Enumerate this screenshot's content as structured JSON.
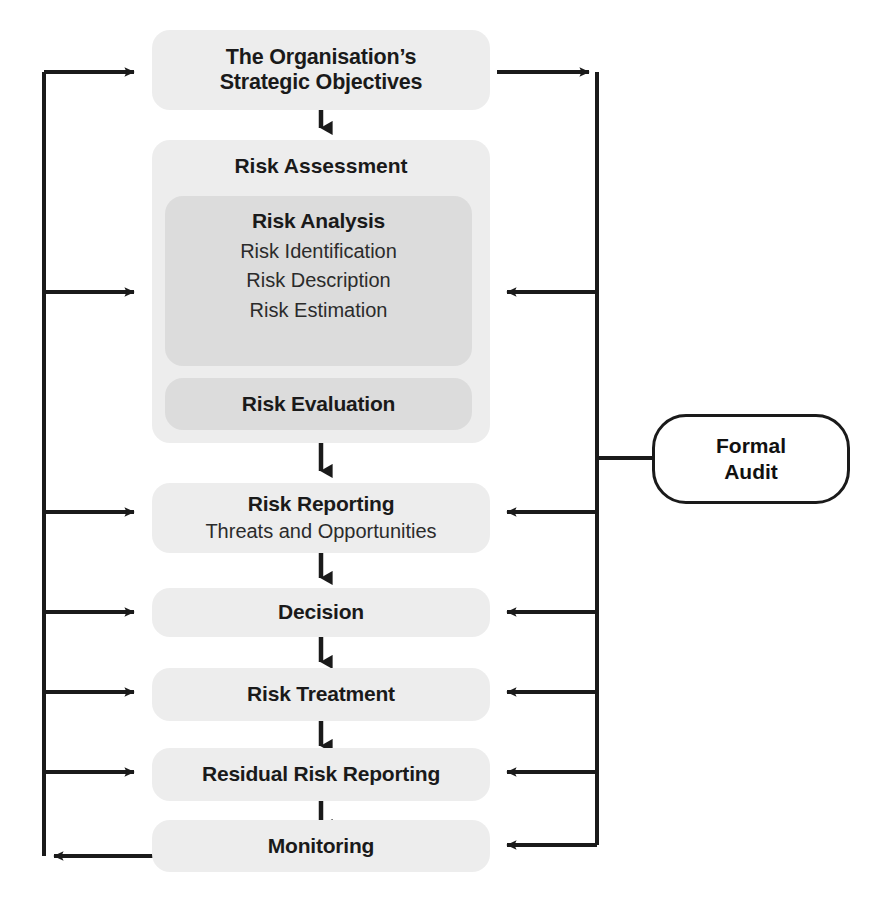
{
  "diagram": {
    "colors": {
      "box_light": "#ededed",
      "box_mid": "#dcdcdc",
      "line": "#1a1a1a",
      "text": "#1a1a1a",
      "background": "#ffffff"
    },
    "nodes": {
      "strategic_objectives": {
        "line1": "The Organisation’s",
        "line2": "Strategic Objectives"
      },
      "risk_assessment": {
        "label": "Risk Assessment"
      },
      "risk_analysis": {
        "label": "Risk Analysis",
        "items": [
          "Risk Identification",
          "Risk Description",
          "Risk Estimation"
        ]
      },
      "risk_evaluation": {
        "label": "Risk Evaluation"
      },
      "risk_reporting": {
        "label": "Risk Reporting",
        "subtitle": "Threats and Opportunities"
      },
      "decision": {
        "label": "Decision"
      },
      "risk_treatment": {
        "label": "Risk Treatment"
      },
      "residual_risk_reporting": {
        "label": "Residual Risk Reporting"
      },
      "monitoring": {
        "label": "Monitoring"
      },
      "formal_audit": {
        "line1": "Formal",
        "line2": "Audit"
      }
    },
    "flow_sequence": [
      "The Organisation’s Strategic Objectives",
      "Risk Assessment",
      "Risk Reporting",
      "Decision",
      "Risk Treatment",
      "Residual Risk Reporting",
      "Monitoring"
    ],
    "connectors": {
      "down_arrows": 6,
      "left_spine_feedback_targets": [
        "The Organisation’s Strategic Objectives",
        "Risk Analysis",
        "Risk Reporting",
        "Decision",
        "Risk Treatment",
        "Residual Risk Reporting"
      ],
      "right_spine_feedback_targets": [
        "Risk Analysis",
        "Risk Reporting",
        "Decision",
        "Risk Treatment",
        "Residual Risk Reporting",
        "Monitoring"
      ],
      "monitoring_returns_to_left_spine": true,
      "objectives_feeds_right_spine": true,
      "formal_audit_attached_to_right_spine": true
    }
  }
}
